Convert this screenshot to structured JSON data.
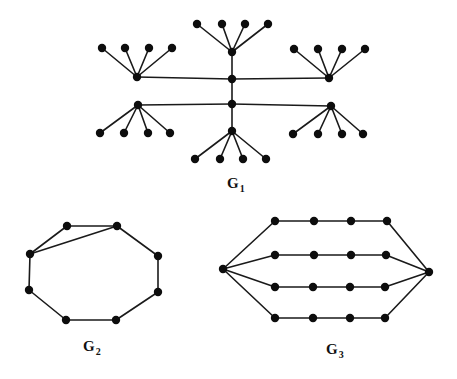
{
  "colors": {
    "edge": "#1a1a1a",
    "node": "#0d0d0d",
    "background": "#ffffff"
  },
  "graphs": [
    {
      "id": "G1",
      "label": {
        "main": "G",
        "sub": "1",
        "x": 227,
        "y": 176
      },
      "nodes": {
        "cU": [
          232,
          79
        ],
        "cL": [
          232,
          104
        ],
        "hT": [
          232,
          52
        ],
        "hB": [
          232,
          131
        ],
        "hLU": [
          137,
          77
        ],
        "hLL": [
          138,
          105
        ],
        "hRU": [
          329,
          78
        ],
        "hRL": [
          331,
          106
        ],
        "t1": [
          197,
          24
        ],
        "t2": [
          222,
          24
        ],
        "t3": [
          245,
          24
        ],
        "t4": [
          268,
          24
        ],
        "lu1": [
          102,
          48
        ],
        "lu2": [
          125,
          48
        ],
        "lu3": [
          149,
          48
        ],
        "lu4": [
          172,
          48
        ],
        "ru1": [
          294,
          49
        ],
        "ru2": [
          318,
          49
        ],
        "ru3": [
          342,
          49
        ],
        "ru4": [
          365,
          49
        ],
        "ll1": [
          100,
          133
        ],
        "ll2": [
          124,
          133
        ],
        "ll3": [
          148,
          133
        ],
        "ll4": [
          170,
          133
        ],
        "rl1": [
          293,
          134
        ],
        "rl2": [
          318,
          134
        ],
        "rl3": [
          342,
          134
        ],
        "rl4": [
          363,
          134
        ],
        "b1": [
          195,
          159
        ],
        "b2": [
          220,
          159
        ],
        "b3": [
          243,
          159
        ],
        "b4": [
          266,
          159
        ]
      },
      "edges": [
        [
          "cU",
          "cL"
        ],
        [
          "cU",
          "hT"
        ],
        [
          "cL",
          "hB"
        ],
        [
          "cU",
          "hLU"
        ],
        [
          "cU",
          "hRU"
        ],
        [
          "cL",
          "hLL"
        ],
        [
          "cL",
          "hRL"
        ],
        [
          "hT",
          "t1"
        ],
        [
          "hT",
          "t2"
        ],
        [
          "hT",
          "t3"
        ],
        [
          "hT",
          "t4"
        ],
        [
          "hLU",
          "lu1"
        ],
        [
          "hLU",
          "lu2"
        ],
        [
          "hLU",
          "lu3"
        ],
        [
          "hLU",
          "lu4"
        ],
        [
          "hRU",
          "ru1"
        ],
        [
          "hRU",
          "ru2"
        ],
        [
          "hRU",
          "ru3"
        ],
        [
          "hRU",
          "ru4"
        ],
        [
          "hLL",
          "ll1"
        ],
        [
          "hLL",
          "ll2"
        ],
        [
          "hLL",
          "ll3"
        ],
        [
          "hLL",
          "ll4"
        ],
        [
          "hRL",
          "rl1"
        ],
        [
          "hRL",
          "rl2"
        ],
        [
          "hRL",
          "rl3"
        ],
        [
          "hRL",
          "rl4"
        ],
        [
          "hB",
          "b1"
        ],
        [
          "hB",
          "b2"
        ],
        [
          "hB",
          "b3"
        ],
        [
          "hB",
          "b4"
        ]
      ]
    },
    {
      "id": "G2",
      "label": {
        "main": "G",
        "sub": "2",
        "x": 83,
        "y": 339
      },
      "nodes": {
        "a": [
          67,
          226
        ],
        "b": [
          117,
          226
        ],
        "c": [
          158,
          256
        ],
        "d": [
          158,
          292
        ],
        "e": [
          116,
          320
        ],
        "f": [
          66,
          320
        ],
        "g": [
          29,
          290
        ],
        "h": [
          30,
          254
        ]
      },
      "edges": [
        [
          "a",
          "b"
        ],
        [
          "b",
          "c"
        ],
        [
          "c",
          "d"
        ],
        [
          "d",
          "e"
        ],
        [
          "e",
          "f"
        ],
        [
          "f",
          "g"
        ],
        [
          "g",
          "h"
        ],
        [
          "h",
          "a"
        ],
        [
          "h",
          "b"
        ]
      ]
    },
    {
      "id": "G3",
      "label": {
        "main": "G",
        "sub": "3",
        "x": 326,
        "y": 342
      },
      "nodes": {
        "L": [
          223,
          269
        ],
        "R": [
          429,
          272
        ],
        "r1a": [
          275,
          221
        ],
        "r1b": [
          314,
          221
        ],
        "r1c": [
          351,
          221
        ],
        "r1d": [
          387,
          221
        ],
        "r2a": [
          275,
          255
        ],
        "r2b": [
          314,
          255
        ],
        "r2c": [
          351,
          255
        ],
        "r2d": [
          386,
          255
        ],
        "r3a": [
          275,
          287
        ],
        "r3b": [
          313,
          287
        ],
        "r3c": [
          350,
          287
        ],
        "r3d": [
          385,
          287
        ],
        "r4a": [
          275,
          318
        ],
        "r4b": [
          313,
          318
        ],
        "r4c": [
          350,
          318
        ],
        "r4d": [
          385,
          318
        ]
      },
      "edges": [
        [
          "L",
          "r1a"
        ],
        [
          "r1a",
          "r1b"
        ],
        [
          "r1b",
          "r1c"
        ],
        [
          "r1c",
          "r1d"
        ],
        [
          "r1d",
          "R"
        ],
        [
          "L",
          "r2a"
        ],
        [
          "r2a",
          "r2b"
        ],
        [
          "r2b",
          "r2c"
        ],
        [
          "r2c",
          "r2d"
        ],
        [
          "r2d",
          "R"
        ],
        [
          "L",
          "r3a"
        ],
        [
          "r3a",
          "r3b"
        ],
        [
          "r3b",
          "r3c"
        ],
        [
          "r3c",
          "r3d"
        ],
        [
          "r3d",
          "R"
        ],
        [
          "L",
          "r4a"
        ],
        [
          "r4a",
          "r4b"
        ],
        [
          "r4b",
          "r4c"
        ],
        [
          "r4c",
          "r4d"
        ],
        [
          "r4d",
          "R"
        ]
      ]
    }
  ]
}
